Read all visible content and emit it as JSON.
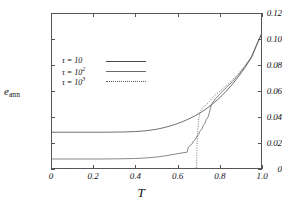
{
  "chart_data": {
    "type": "line",
    "title": "",
    "xlabel": "T",
    "ylabel": "e_ann",
    "ylabel_symbol": "e",
    "ylabel_subscript": "ann",
    "xlim": [
      0,
      1.0
    ],
    "ylim": [
      0,
      0.12
    ],
    "grid": false,
    "legend_position": "upper-left-inside",
    "xticks": [
      "0",
      "0.2",
      "0.4",
      "0.6",
      "0.8",
      "1.0"
    ],
    "xtick_values": [
      0,
      0.2,
      0.4,
      0.6,
      0.8,
      1.0
    ],
    "yticks": [
      "0",
      "0.02",
      "0.04",
      "0.06",
      "0.08",
      "0.10",
      "0.12"
    ],
    "ytick_values": [
      0,
      0.02,
      0.04,
      0.06,
      0.08,
      0.1,
      0.12
    ],
    "series": [
      {
        "name": "tau = 10",
        "legend_prefix": "τ = 10",
        "legend_exponent": "",
        "style": "solid",
        "color": "#4a4a4a",
        "x": [
          0.0,
          0.05,
          0.1,
          0.15,
          0.2,
          0.25,
          0.3,
          0.35,
          0.4,
          0.45,
          0.5,
          0.53,
          0.56,
          0.59,
          0.62,
          0.65,
          0.68,
          0.71,
          0.74,
          0.77,
          0.8,
          0.83,
          0.86,
          0.89,
          0.92,
          0.95,
          0.98,
          1.0
        ],
        "values": [
          0.0283,
          0.0283,
          0.0283,
          0.0283,
          0.0283,
          0.0283,
          0.0284,
          0.0285,
          0.0288,
          0.0294,
          0.0306,
          0.0316,
          0.0329,
          0.0344,
          0.0362,
          0.0383,
          0.0407,
          0.0435,
          0.0468,
          0.0506,
          0.0549,
          0.0598,
          0.0653,
          0.0714,
          0.0782,
          0.0857,
          0.0973,
          0.1046
        ]
      },
      {
        "name": "tau = 10^2",
        "legend_prefix": "τ = 10",
        "legend_exponent": "2",
        "style": "solid",
        "color": "#6a6a6a",
        "x": [
          0.0,
          0.05,
          0.1,
          0.15,
          0.2,
          0.25,
          0.3,
          0.35,
          0.4,
          0.45,
          0.5,
          0.54,
          0.58,
          0.61,
          0.63,
          0.645,
          0.65,
          0.655,
          0.66,
          0.67,
          0.675,
          0.685,
          0.69,
          0.7,
          0.705,
          0.715,
          0.72,
          0.73,
          0.735,
          0.745,
          0.75,
          0.755,
          0.76,
          0.78,
          0.8,
          0.83,
          0.86,
          0.89,
          0.92,
          0.95,
          0.98,
          1.0
        ],
        "values": [
          0.0077,
          0.0077,
          0.0077,
          0.0077,
          0.0077,
          0.0077,
          0.0078,
          0.0079,
          0.0081,
          0.0085,
          0.0092,
          0.0101,
          0.0112,
          0.0121,
          0.0126,
          0.0129,
          0.0162,
          0.0175,
          0.0182,
          0.0196,
          0.0215,
          0.0228,
          0.0246,
          0.0268,
          0.0289,
          0.0305,
          0.0331,
          0.0352,
          0.0378,
          0.0402,
          0.0432,
          0.0462,
          0.0497,
          0.0541,
          0.0576,
          0.0626,
          0.0672,
          0.0728,
          0.079,
          0.0861,
          0.0975,
          0.1046
        ]
      },
      {
        "name": "tau = 10^3",
        "legend_prefix": "τ = 10",
        "legend_exponent": "3",
        "style": "dotted",
        "color": "#5a5a5a",
        "x": [
          0.0,
          0.1,
          0.2,
          0.3,
          0.4,
          0.5,
          0.55,
          0.6,
          0.63,
          0.66,
          0.68,
          0.685,
          0.69,
          0.692,
          0.695,
          0.7,
          0.705,
          0.71,
          0.715,
          0.72,
          0.725,
          0.73,
          0.735,
          0.74,
          0.745,
          0.75,
          0.755,
          0.76,
          0.78,
          0.8,
          0.83,
          0.86,
          0.89,
          0.92,
          0.95,
          0.98,
          1.0
        ],
        "values": [
          0.0002,
          0.0002,
          0.0002,
          0.0002,
          0.0002,
          0.0002,
          0.0002,
          0.0002,
          0.0002,
          0.0002,
          0.0002,
          0.0002,
          0.0002,
          0.018,
          0.029,
          0.0385,
          0.0425,
          0.0448,
          0.0462,
          0.0472,
          0.048,
          0.0487,
          0.0494,
          0.0502,
          0.051,
          0.0519,
          0.0529,
          0.054,
          0.0572,
          0.0597,
          0.064,
          0.0686,
          0.0737,
          0.0796,
          0.0866,
          0.0978,
          0.1046
        ]
      }
    ]
  }
}
